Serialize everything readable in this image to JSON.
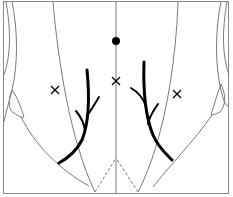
{
  "diagram": {
    "colors": {
      "frame": "#8a8a8a",
      "outline": "#7a7a7a",
      "ink": "#000000",
      "background": "#ffffff"
    },
    "marks": {
      "dot": {
        "label": "dot",
        "cx": 116,
        "cy": 41,
        "r": 4
      },
      "crosses": [
        {
          "label": "left-cross",
          "cx": 55,
          "cy": 90
        },
        {
          "label": "center-cross",
          "cx": 116,
          "cy": 81
        },
        {
          "label": "right-cross",
          "cx": 177,
          "cy": 94
        }
      ]
    }
  }
}
